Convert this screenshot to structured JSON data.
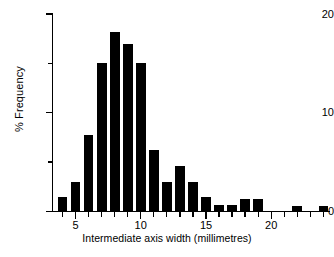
{
  "figure": {
    "background": "#ffffff",
    "ink_color": "#000000",
    "bar_color": "#000000"
  },
  "chart_data": {
    "type": "bar",
    "title": "",
    "xlabel": "Intermediate axis width (millimetres)",
    "ylabel": "% Frequency",
    "xlim": [
      3.3,
      24.8
    ],
    "ylim": [
      0,
      20
    ],
    "grid": false,
    "legend": null,
    "bar_width_mm": 0.75,
    "x_major_ticks": [
      5,
      10,
      15,
      20
    ],
    "x_major_tick_labels": [
      "5",
      "10",
      "15",
      "20"
    ],
    "x_minor_ticks": [
      4,
      6,
      7,
      8,
      9,
      11,
      12,
      13,
      14,
      16,
      17,
      18,
      19,
      21,
      22,
      23,
      24
    ],
    "y_major_ticks": [
      0,
      10,
      20
    ],
    "y_major_tick_labels": [
      "0",
      "10",
      "20"
    ],
    "y_minor_ticks": [
      5,
      15
    ],
    "categories": [
      4,
      5,
      6,
      7,
      8,
      9,
      10,
      11,
      12,
      13,
      14,
      15,
      16,
      17,
      18,
      19,
      20,
      21,
      22,
      23,
      24
    ],
    "values": [
      1.5,
      3.0,
      7.7,
      15.0,
      18.2,
      17.0,
      15.0,
      6.2,
      3.0,
      4.6,
      3.0,
      1.5,
      0.7,
      0.7,
      1.3,
      1.3,
      0,
      0,
      0.6,
      0,
      0.6
    ],
    "x": [
      4,
      5,
      6,
      7,
      8,
      9,
      10,
      11,
      12,
      13,
      14,
      15,
      16,
      17,
      18,
      19,
      22,
      24
    ],
    "y": [
      1.5,
      3.0,
      7.7,
      15.0,
      18.2,
      17.0,
      15.0,
      6.2,
      3.0,
      4.6,
      3.0,
      1.5,
      0.7,
      0.7,
      1.3,
      1.3,
      0.6,
      0.6
    ]
  },
  "caption": {
    "text": ""
  }
}
